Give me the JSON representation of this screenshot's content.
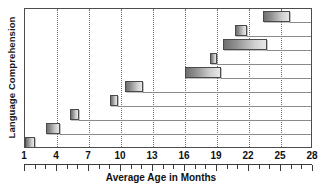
{
  "chart_data": {
    "type": "bar",
    "orientation": "horizontal-range",
    "title": "",
    "xlabel": "Average Age in Months",
    "ylabel": "Language Comprehension",
    "xlim": [
      1,
      28
    ],
    "ylim": [
      0,
      10
    ],
    "grid": true,
    "gridlines_x": [
      4,
      7,
      10,
      13,
      16,
      19,
      22,
      25
    ],
    "tick_labels": [
      "1",
      "4",
      "7",
      "10",
      "13",
      "16",
      "19",
      "22",
      "25",
      "28"
    ],
    "tick_values": [
      1,
      4,
      7,
      10,
      13,
      16,
      19,
      22,
      25,
      28
    ],
    "minor_tick_step": 1,
    "legend": "none",
    "categories": [
      "Milestone 1",
      "Milestone 2",
      "Milestone 3",
      "Milestone 4",
      "Milestone 5",
      "Milestone 6",
      "Milestone 7",
      "Milestone 8",
      "Milestone 9",
      "Milestone 10"
    ],
    "bars": [
      {
        "row": 1,
        "start": 1.0,
        "end": 1.9
      },
      {
        "row": 2,
        "start": 3.0,
        "end": 4.3
      },
      {
        "row": 3,
        "start": 5.2,
        "end": 6.1
      },
      {
        "row": 4,
        "start": 9.0,
        "end": 9.7
      },
      {
        "row": 5,
        "start": 10.4,
        "end": 12.1
      },
      {
        "row": 6,
        "start": 16.0,
        "end": 19.4
      },
      {
        "row": 7,
        "start": 18.3,
        "end": 19.0
      },
      {
        "row": 8,
        "start": 19.6,
        "end": 23.7
      },
      {
        "row": 9,
        "start": 20.7,
        "end": 21.8
      },
      {
        "row": 10,
        "start": 23.3,
        "end": 25.8
      }
    ],
    "colors": {
      "bar_dark": "#6f6f6f",
      "bar_light": "#e8e8e8",
      "bar_border": "#4a4a4a",
      "gridline": "#6e6e6e",
      "rowline": "#8a8a8a",
      "axis": "#4d4d4d",
      "text": "#111111",
      "background": "#ffffff"
    }
  }
}
